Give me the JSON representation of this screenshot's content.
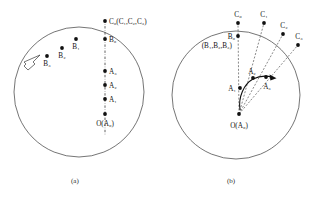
{
  "figure": {
    "caption_a": "(a)",
    "caption_b": "(b)",
    "stroke_color": "#3a3a3a",
    "point_color": "#111111",
    "dash_color": "#4a4a4a"
  },
  "panel_a": {
    "circle": {
      "cx": 79,
      "cy": 92,
      "r": 65
    },
    "axis_line": {
      "x": 105,
      "y_top": 20,
      "y_bottom": 135,
      "style": "dash-dot"
    },
    "arrow": {
      "label": "flow-arrow",
      "direction": "down-left",
      "style": "hollow-outline"
    },
    "points": [
      {
        "name": "C0",
        "label": "C₀(C₁,C₂,C₃)",
        "x": 105,
        "y": 21,
        "label_x": 109,
        "label_y": 22,
        "anchor": "start"
      },
      {
        "name": "B0",
        "label": "B₀",
        "x": 105,
        "y": 39,
        "label_x": 109,
        "label_y": 41,
        "anchor": "start"
      },
      {
        "name": "B1",
        "label": "B₁",
        "x": 76,
        "y": 39,
        "label_x": 79,
        "label_y": 48,
        "anchor": "start"
      },
      {
        "name": "B2",
        "label": "B₂",
        "x": 62,
        "y": 48,
        "label_x": 65,
        "label_y": 57,
        "anchor": "start"
      },
      {
        "name": "B3",
        "label": "B₃",
        "x": 47,
        "y": 56,
        "label_x": 50,
        "label_y": 65,
        "anchor": "start"
      },
      {
        "name": "A3",
        "label": "A₃",
        "x": 105,
        "y": 71,
        "label_x": 109,
        "label_y": 73,
        "anchor": "start"
      },
      {
        "name": "A2",
        "label": "A₂",
        "x": 105,
        "y": 85,
        "label_x": 109,
        "label_y": 87,
        "anchor": "start"
      },
      {
        "name": "A1",
        "label": "A₁",
        "x": 105,
        "y": 99,
        "label_x": 109,
        "label_y": 101,
        "anchor": "start"
      },
      {
        "name": "O",
        "label": "O(A₀)",
        "x": 105,
        "y": 114,
        "label_x": 105,
        "label_y": 125,
        "anchor": "middle"
      }
    ]
  },
  "panel_b": {
    "circle": {
      "cx": 236,
      "cy": 95,
      "r": 64
    },
    "rays": [
      {
        "name": "ray-C0",
        "x2": 238,
        "y2": 22
      },
      {
        "name": "ray-C1",
        "x2": 264,
        "y2": 22
      },
      {
        "name": "ray-C2",
        "x2": 283,
        "y2": 33
      },
      {
        "name": "ray-C3",
        "x2": 298,
        "y2": 44
      }
    ],
    "origin": {
      "x": 239,
      "y": 114
    },
    "curve_arrow": {
      "label": "rotation-arrow",
      "from": "A1",
      "to": "A3"
    },
    "points": [
      {
        "name": "C0",
        "label": "C₀",
        "x": 238,
        "y": 22,
        "label_x": 238,
        "label_y": 16,
        "anchor": "middle"
      },
      {
        "name": "C1",
        "label": "C₁",
        "x": 264,
        "y": 22,
        "label_x": 264,
        "label_y": 16,
        "anchor": "middle"
      },
      {
        "name": "C2",
        "label": "C₂",
        "x": 283,
        "y": 33,
        "label_x": 284,
        "label_y": 27,
        "anchor": "middle"
      },
      {
        "name": "C3",
        "label": "C₃",
        "x": 298,
        "y": 44,
        "label_x": 299,
        "label_y": 38,
        "anchor": "middle"
      },
      {
        "name": "B0",
        "label": "B₀",
        "x": 238,
        "y": 36,
        "label_x": 235,
        "label_y": 38,
        "anchor": "end"
      },
      {
        "name": "A1",
        "label": "A₁",
        "x": 239,
        "y": 88,
        "label_x": 235,
        "label_y": 90,
        "anchor": "end"
      },
      {
        "name": "A2",
        "label": "A₂",
        "x": 252,
        "y": 77,
        "label_x": 252,
        "label_y": 74,
        "anchor": "middle"
      },
      {
        "name": "A3",
        "label": "A₃",
        "x": 265,
        "y": 78,
        "label_x": 266,
        "label_y": 88,
        "anchor": "middle"
      },
      {
        "name": "O",
        "label": "O(A₀)",
        "x": 239,
        "y": 114,
        "label_x": 239,
        "label_y": 127,
        "anchor": "middle"
      }
    ],
    "b_group_label": "(B₁,B₂,B₃)",
    "b_group_label_x": 232,
    "b_group_label_y": 46
  }
}
